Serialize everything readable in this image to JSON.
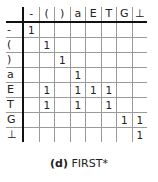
{
  "table": {
    "columns": [
      "-",
      "(",
      ")",
      "a",
      "E",
      "T",
      "G",
      "⊥"
    ],
    "rows": [
      {
        "label": "-",
        "cells": [
          "1",
          "",
          "",
          "",
          "",
          "",
          "",
          ""
        ]
      },
      {
        "label": "(",
        "cells": [
          "",
          "1",
          "",
          "",
          "",
          "",
          "",
          ""
        ]
      },
      {
        "label": ")",
        "cells": [
          "",
          "",
          "1",
          "",
          "",
          "",
          "",
          ""
        ]
      },
      {
        "label": "a",
        "cells": [
          "",
          "",
          "",
          "1",
          "",
          "",
          "",
          ""
        ]
      },
      {
        "label": "E",
        "cells": [
          "",
          "1",
          "",
          "1",
          "1",
          "1",
          "",
          ""
        ]
      },
      {
        "label": "T",
        "cells": [
          "",
          "1",
          "",
          "1",
          "",
          "1",
          "",
          ""
        ]
      },
      {
        "label": "G",
        "cells": [
          "",
          "",
          "",
          "",
          "",
          "",
          "1",
          "1"
        ]
      },
      {
        "label": "⊥",
        "cells": [
          "",
          "",
          "",
          "",
          "",
          "",
          "",
          "1"
        ]
      }
    ]
  },
  "caption": {
    "label": "(d)",
    "text": "FIRST*"
  }
}
